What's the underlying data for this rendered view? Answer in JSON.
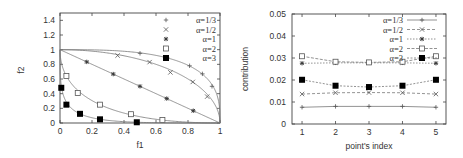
{
  "chart_data": [
    {
      "type": "line",
      "title": "",
      "xlabel": "f1",
      "ylabel": "f2",
      "xlim": [
        0,
        1
      ],
      "ylim": [
        0,
        1.5
      ],
      "xticks": [
        "0",
        "0.2",
        "0.4",
        "0.6",
        "0.8",
        "1"
      ],
      "yticks": [
        "0",
        "0.2",
        "0.4",
        "0.6",
        "0.8",
        "1",
        "1.2",
        "1.4"
      ],
      "grid": false,
      "legend_position": "upper right",
      "series": [
        {
          "name": "α=1/3",
          "marker": "plus",
          "points": [
            [
              0.5,
              0.95
            ],
            [
              0.67,
              0.89
            ],
            [
              0.81,
              0.78
            ],
            [
              0.89,
              0.67
            ],
            [
              0.95,
              0.5
            ]
          ]
        },
        {
          "name": "α=1/2",
          "marker": "cross",
          "points": [
            [
              0.36,
              0.92
            ],
            [
              0.56,
              0.83
            ],
            [
              0.69,
              0.69
            ],
            [
              0.83,
              0.56
            ],
            [
              0.92,
              0.36
            ]
          ]
        },
        {
          "name": "α=1",
          "marker": "star",
          "points": [
            [
              0.167,
              0.833
            ],
            [
              0.333,
              0.667
            ],
            [
              0.5,
              0.5
            ],
            [
              0.667,
              0.333
            ],
            [
              0.833,
              0.167
            ]
          ]
        },
        {
          "name": "α=2",
          "marker": "open-square",
          "points": [
            [
              0.04,
              0.64
            ],
            [
              0.111,
              0.41
            ],
            [
              0.25,
              0.25
            ],
            [
              0.444,
              0.12
            ],
            [
              0.64,
              0.04
            ]
          ]
        },
        {
          "name": "α=3",
          "marker": "filled-square",
          "points": [
            [
              0.008,
              0.48
            ],
            [
              0.04,
              0.25
            ],
            [
              0.125,
              0.125
            ],
            [
              0.25,
              0.05
            ],
            [
              0.48,
              0.01
            ]
          ]
        }
      ]
    },
    {
      "type": "line",
      "title": "",
      "xlabel": "point's index",
      "ylabel": "contribution",
      "xlim": [
        0.7,
        5.3
      ],
      "ylim": [
        0,
        0.05
      ],
      "categories": [
        "1",
        "2",
        "3",
        "4",
        "5"
      ],
      "yticks": [
        "0",
        "0.01",
        "0.02",
        "0.03",
        "0.04",
        "0.05"
      ],
      "grid": false,
      "legend_position": "upper right",
      "series": [
        {
          "name": "α=1/3",
          "marker": "plus",
          "values": [
            0.0076,
            0.008,
            0.008,
            0.008,
            0.0076
          ]
        },
        {
          "name": "α=1/2",
          "marker": "cross",
          "values": [
            0.0136,
            0.0142,
            0.0143,
            0.0142,
            0.0136
          ]
        },
        {
          "name": "α=1",
          "marker": "star",
          "values": [
            0.0276,
            0.0278,
            0.0278,
            0.0278,
            0.0276
          ]
        },
        {
          "name": "α=2",
          "marker": "open-square",
          "values": [
            0.0308,
            0.0283,
            0.028,
            0.0283,
            0.0308
          ]
        },
        {
          "name": "α=3",
          "marker": "filled-square",
          "values": [
            0.0201,
            0.0174,
            0.0168,
            0.0174,
            0.0201
          ]
        }
      ]
    }
  ]
}
